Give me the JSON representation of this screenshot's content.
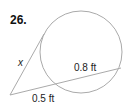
{
  "problem": {
    "number": "26.",
    "variable_label": "x",
    "internal_segment_label": "0.8 ft",
    "external_segment_label": "0.5 ft"
  },
  "geometry": {
    "circle": {
      "cx": 81,
      "cy": 52,
      "r": 41
    },
    "external_point": {
      "x": 10,
      "y": 95
    },
    "tangent_point": {
      "x": 44,
      "y": 34
    },
    "secant_near": {
      "x": 55,
      "y": 83
    },
    "secant_far": {
      "x": 121,
      "y": 68
    },
    "stroke_color": "#aaaaaa"
  }
}
